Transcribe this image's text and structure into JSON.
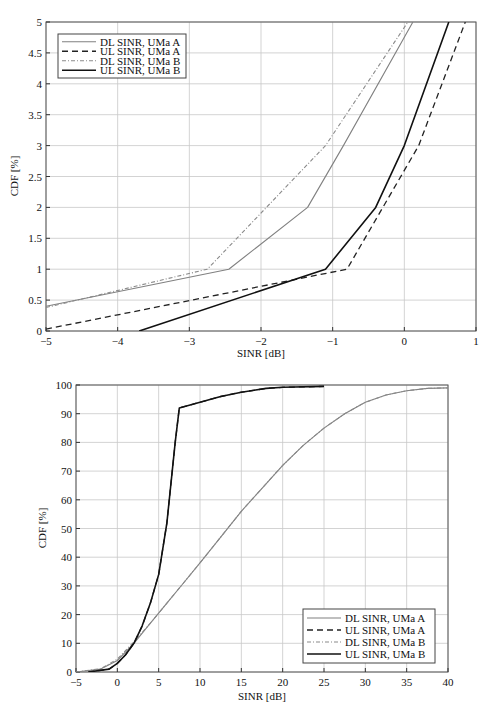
{
  "chart_data": [
    {
      "type": "line",
      "title": "",
      "xlabel": "SINR [dB]",
      "ylabel": "CDF [%]",
      "xlim": [
        -5,
        1
      ],
      "ylim": [
        0,
        5
      ],
      "xticks": [
        -5,
        -4,
        -3,
        -2,
        -1,
        0,
        1
      ],
      "yticks": [
        0,
        0.5,
        1,
        1.5,
        2,
        2.5,
        3,
        3.5,
        4,
        4.5,
        5
      ],
      "xtick_labels": [
        "−5",
        "−4",
        "−3",
        "−2",
        "−1",
        "0",
        "1"
      ],
      "ytick_labels": [
        "0",
        "0.5",
        "1",
        "1.5",
        "2",
        "2.5",
        "3",
        "3.5",
        "4",
        "4.5",
        "5"
      ],
      "grid": true,
      "legend_position": "upper left",
      "series": [
        {
          "name": "DL SINR, UMa A",
          "style": "solid",
          "color": "#808080",
          "x": [
            -5,
            -2.45,
            -1.35,
            -0.85,
            0.12
          ],
          "y": [
            0.4,
            1.0,
            2.0,
            3.0,
            5.0
          ]
        },
        {
          "name": "UL SINR,  UMa A",
          "style": "dashed",
          "color": "#222222",
          "x": [
            -5,
            -0.8,
            0.2,
            0.85
          ],
          "y": [
            0.03,
            1.0,
            3.0,
            5.0
          ]
        },
        {
          "name": "DL SINR, UMa B",
          "style": "dashdot",
          "color": "#8a8a8a",
          "x": [
            -5,
            -2.75,
            -1.1,
            0.05
          ],
          "y": [
            0.38,
            1.0,
            3.0,
            5.0
          ]
        },
        {
          "name": "UL SINR,  UMa B",
          "style": "solid",
          "color": "#111111",
          "x": [
            -3.7,
            -1.1,
            -0.4,
            0.0,
            0.62
          ],
          "y": [
            0.0,
            1.0,
            2.0,
            3.0,
            5.0
          ]
        }
      ]
    },
    {
      "type": "line",
      "title": "",
      "xlabel": "SINR [dB]",
      "ylabel": "CDF [%]",
      "xlim": [
        -5,
        40
      ],
      "ylim": [
        0,
        100
      ],
      "xticks": [
        -5,
        0,
        5,
        10,
        15,
        20,
        25,
        30,
        35,
        40
      ],
      "yticks": [
        0,
        10,
        20,
        30,
        40,
        50,
        60,
        70,
        80,
        90,
        100
      ],
      "xtick_labels": [
        "−5",
        "0",
        "5",
        "10",
        "15",
        "20",
        "25",
        "30",
        "35",
        "40"
      ],
      "ytick_labels": [
        "0",
        "10",
        "20",
        "30",
        "40",
        "50",
        "60",
        "70",
        "80",
        "90",
        "100"
      ],
      "grid": true,
      "legend_position": "lower right",
      "series": [
        {
          "name": "DL SINR, UMa A",
          "style": "solid",
          "color": "#808080",
          "x": [
            -5,
            -2,
            0,
            2,
            4,
            6,
            8,
            10,
            12.5,
            15,
            17.5,
            20,
            22.5,
            25,
            27.5,
            30,
            32.5,
            35,
            37.5,
            40
          ],
          "y": [
            0,
            1,
            4,
            10,
            17,
            24,
            31,
            38,
            47,
            56,
            64,
            72,
            79,
            85,
            90,
            94,
            96.5,
            98,
            98.8,
            99
          ]
        },
        {
          "name": "UL SINR,  UMa A",
          "style": "dashed",
          "color": "#222222",
          "x": [
            -3.5,
            -1,
            0,
            1,
            2,
            3,
            4,
            5,
            6,
            7,
            7.5,
            10,
            12.5,
            15,
            18,
            20,
            25
          ],
          "y": [
            0,
            1,
            3,
            6,
            10,
            16,
            24,
            34,
            52,
            80,
            92,
            94,
            96,
            97.5,
            98.8,
            99.2,
            99.5
          ]
        },
        {
          "name": "DL SINR, UMa B",
          "style": "dashdot",
          "color": "#8a8a8a",
          "x": [
            -5,
            -2,
            0,
            2,
            4,
            6,
            8,
            10,
            12.5,
            15,
            17.5,
            20,
            22.5,
            25,
            27.5,
            30,
            32.5,
            35,
            37.5,
            40
          ],
          "y": [
            0,
            1.2,
            4.5,
            10.5,
            17,
            24,
            31,
            38,
            47,
            56,
            64,
            72,
            79,
            85,
            90,
            94,
            96.5,
            98,
            98.8,
            99
          ]
        },
        {
          "name": "UL SINR,  UMa B",
          "style": "solid",
          "color": "#111111",
          "x": [
            -3.5,
            -1,
            0,
            1,
            2,
            3,
            4,
            5,
            6,
            7,
            7.5,
            10,
            12.5,
            15,
            18,
            20,
            25
          ],
          "y": [
            0,
            1,
            3,
            6,
            10,
            16,
            24,
            34,
            52,
            80,
            92,
            94,
            96,
            97.5,
            98.8,
            99.2,
            99.5
          ]
        }
      ]
    }
  ],
  "plots": [
    {
      "box": {
        "left": 46,
        "top": 22,
        "right": 476,
        "bottom": 331
      },
      "legend": {
        "x": 58,
        "y": 34,
        "w": 128,
        "h": 44
      },
      "xlabel_pos": {
        "x": 261,
        "y": 357
      },
      "ylabel_pos": {
        "x": 18,
        "y": 176
      }
    },
    {
      "box": {
        "left": 76,
        "top": 385,
        "right": 448,
        "bottom": 672
      },
      "legend": {
        "x": 303,
        "y": 609,
        "w": 132,
        "h": 54
      },
      "xlabel_pos": {
        "x": 262,
        "y": 700
      },
      "ylabel_pos": {
        "x": 46,
        "y": 528
      }
    }
  ]
}
